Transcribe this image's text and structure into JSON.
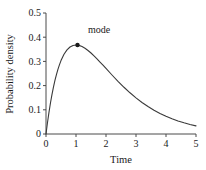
{
  "chart_data": {
    "type": "line",
    "title": "",
    "subtitle": "",
    "xlabel": "Time",
    "ylabel": "Probability density",
    "xlim": [
      0,
      5
    ],
    "ylim": [
      0,
      0.5
    ],
    "grid": false,
    "legend": null,
    "xticks": [
      "0",
      "1",
      "2",
      "3",
      "4",
      "5"
    ],
    "xtick_values": [
      0,
      1,
      2,
      3,
      4,
      5
    ],
    "yticks": [
      "0",
      "0.1",
      "0.2",
      "0.3",
      "0.4",
      "0.5"
    ],
    "ytick_values": [
      0,
      0.1,
      0.2,
      0.3,
      0.4,
      0.5
    ],
    "series": [
      {
        "name": "probability density",
        "color": "#3a3a3a",
        "x": [
          0,
          0.05,
          0.1,
          0.15,
          0.2,
          0.25,
          0.3,
          0.35,
          0.4,
          0.45,
          0.5,
          0.6,
          0.7,
          0.8,
          0.9,
          1.0,
          1.1,
          1.2,
          1.3,
          1.4,
          1.5,
          1.6,
          1.7,
          1.8,
          1.9,
          2.0,
          2.2,
          2.4,
          2.6,
          2.8,
          3.0,
          3.2,
          3.4,
          3.6,
          3.8,
          4.0,
          4.2,
          4.4,
          4.6,
          4.8,
          5.0
        ],
        "y": [
          0,
          0.0476,
          0.0905,
          0.1291,
          0.1637,
          0.1947,
          0.2222,
          0.2466,
          0.2681,
          0.2869,
          0.3033,
          0.3293,
          0.3476,
          0.3595,
          0.3659,
          0.3679,
          0.3662,
          0.3614,
          0.3543,
          0.3452,
          0.3347,
          0.323,
          0.3106,
          0.2975,
          0.2842,
          0.2707,
          0.2438,
          0.2177,
          0.1931,
          0.1703,
          0.1494,
          0.1304,
          0.1135,
          0.0984,
          0.085,
          0.0733,
          0.063,
          0.054,
          0.0462,
          0.0394,
          0.0337
        ]
      }
    ],
    "annotations": [
      {
        "label": "mode",
        "marker": "point",
        "x": 1.05,
        "y": 0.368,
        "label_x": 1.4,
        "label_y": 0.418,
        "color": "#1a1a1a"
      }
    ]
  },
  "axes": {
    "x_title": "Time",
    "y_title": "Probability density"
  }
}
